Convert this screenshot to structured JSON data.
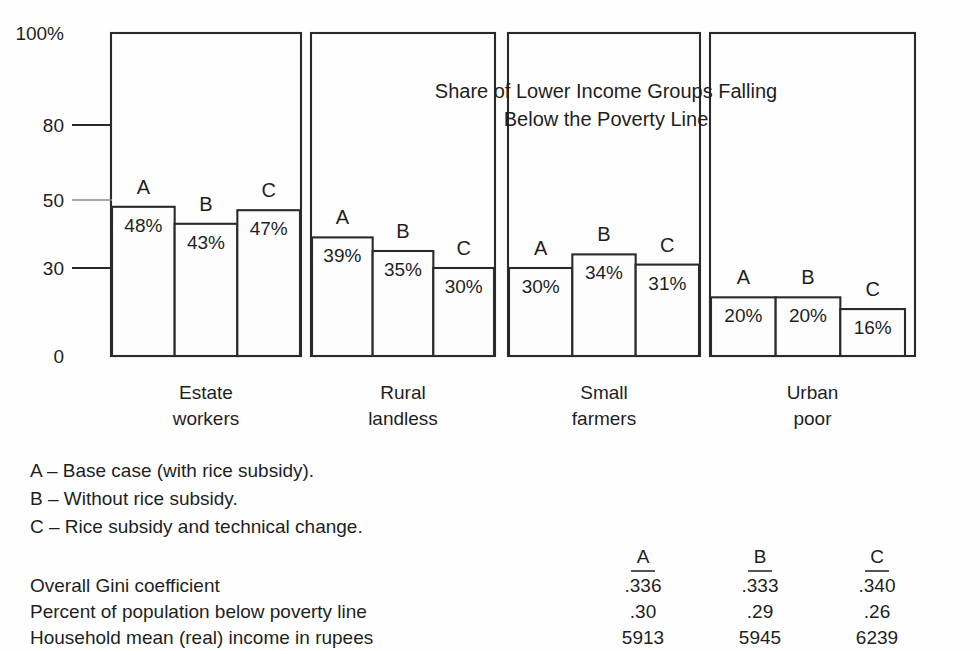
{
  "chart_data": {
    "type": "bar",
    "title_line1": "Share of Lower Income Groups Falling",
    "title_line2": "Below the Poverty Line",
    "xlabel": "",
    "ylabel": "",
    "grid": false,
    "legend_position": "below-plot",
    "ylim": [
      0,
      100
    ],
    "y_ticks": [
      {
        "label": "100%",
        "value": 100
      },
      {
        "label": "80",
        "value": 80
      },
      {
        "label": "50",
        "value": 50
      },
      {
        "label": "30",
        "value": 30
      },
      {
        "label": "0",
        "value": 0
      }
    ],
    "categories": [
      "Estate workers",
      "Rural landless",
      "Small farmers",
      "Urban poor"
    ],
    "category_lines": [
      [
        "Estate",
        "workers"
      ],
      [
        "Rural",
        "landless"
      ],
      [
        "Small",
        "farmers"
      ],
      [
        "Urban",
        "poor"
      ]
    ],
    "series": [
      {
        "name": "A",
        "values": [
          48,
          39,
          30,
          20
        ],
        "labels": [
          "48%",
          "39%",
          "30%",
          "20%"
        ]
      },
      {
        "name": "B",
        "values": [
          43,
          35,
          34,
          20
        ],
        "labels": [
          "43%",
          "35%",
          "34%",
          "20%"
        ]
      },
      {
        "name": "C",
        "values": [
          47,
          30,
          31,
          16
        ],
        "labels": [
          "47%",
          "30%",
          "31%",
          "16%"
        ]
      }
    ],
    "legend": [
      {
        "key": "A",
        "dash": "–",
        "text": "Base case (with rice subsidy)."
      },
      {
        "key": "B",
        "dash": "–",
        "text": "Without rice subsidy."
      },
      {
        "key": "C",
        "dash": "–",
        "text": "Rice subsidy and technical change."
      }
    ],
    "annotations": []
  },
  "summary_table": {
    "columns": [
      "A",
      "B",
      "C"
    ],
    "rows": [
      {
        "label": "Overall Gini coefficient",
        "values": [
          ".336",
          ".333",
          ".340"
        ]
      },
      {
        "label": "Percent of population below poverty line",
        "values": [
          ".30",
          ".29",
          ".26"
        ]
      },
      {
        "label": "Household mean (real) income in rupees",
        "values": [
          "5913",
          "5945",
          "6239"
        ]
      }
    ]
  },
  "colors": {
    "ink": "#2a2a2a",
    "background": "#fefefe",
    "bar_fill": "#fdfdfd",
    "faint_rule": "#8e8e8e"
  }
}
